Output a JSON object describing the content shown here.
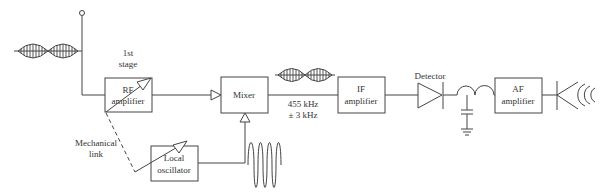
{
  "diagram": {
    "blocks": {
      "rf_amplifier": {
        "line1": "RF",
        "line2": "amplifier"
      },
      "mixer": {
        "label": "Mixer"
      },
      "if_amplifier": {
        "line1": "IF",
        "line2": "amplifier"
      },
      "af_amplifier": {
        "line1": "AF",
        "line2": "amplifier"
      },
      "local_oscillator": {
        "line1": "Local",
        "line2": "oscillator"
      }
    },
    "labels": {
      "first_stage_line1": "1st",
      "first_stage_line2": "stage",
      "mechanical_link_line1": "Mechanical",
      "mechanical_link_line2": "link",
      "if_freq_line1": "455 kHz",
      "if_freq_line2": "± 3 kHz",
      "detector": "Detector"
    },
    "colors": {
      "line": "#444444",
      "text": "#333333",
      "background": "#ffffff"
    }
  }
}
